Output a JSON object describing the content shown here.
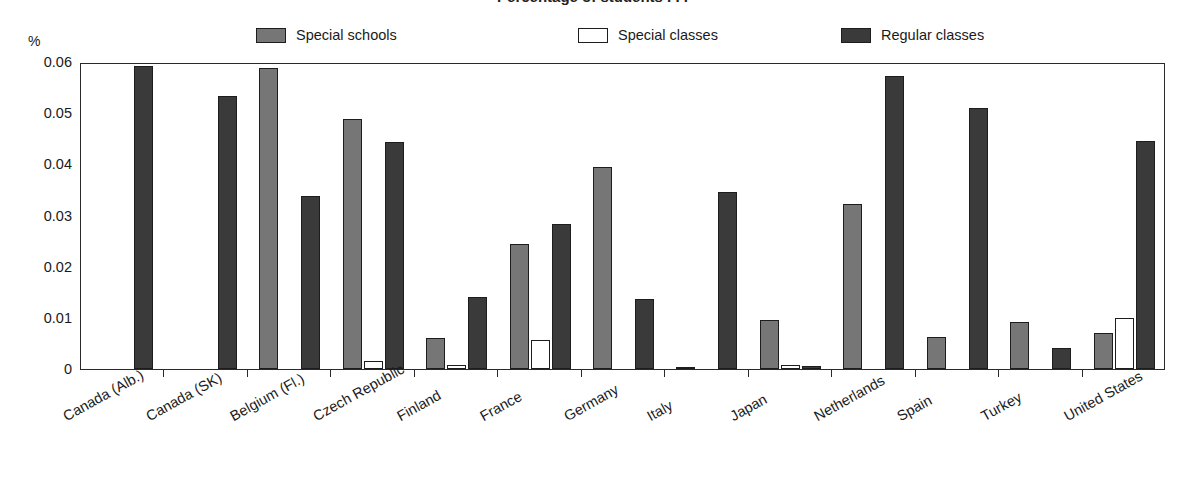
{
  "title_partial": "Percentage of students . . .",
  "axis": {
    "unit_label": "%",
    "y_ticks": [
      "0.06",
      "0.05",
      "0.04",
      "0.03",
      "0.02",
      "0.01",
      "0"
    ]
  },
  "legend": {
    "items": [
      {
        "label": "Special schools",
        "swatch": "#767676",
        "key": "special_schools"
      },
      {
        "label": "Special classes",
        "swatch": "#ffffff",
        "key": "special_classes"
      },
      {
        "label": "Regular classes",
        "swatch": "#3a3a3a",
        "key": "regular_classes"
      }
    ]
  },
  "chart_data": {
    "type": "bar",
    "title": "Percentage of students . . .",
    "xlabel": "",
    "ylabel": "%",
    "ylim": [
      0,
      0.06
    ],
    "yticks": [
      0,
      0.01,
      0.02,
      0.03,
      0.04,
      0.05,
      0.06
    ],
    "grid": false,
    "legend_position": "top",
    "categories": [
      "Canada (Alb.)",
      "Canada (SK)",
      "Belgium (Fl.)",
      "Czech Republic",
      "Finland",
      "France",
      "Germany",
      "Italy",
      "Japan",
      "Netherlands",
      "Spain",
      "Turkey",
      "United States"
    ],
    "series": [
      {
        "name": "Special schools",
        "color": "#767676",
        "values": [
          0,
          0,
          0.0588,
          0.0489,
          0.006,
          0.0245,
          0.0395,
          0.0004,
          0.0095,
          0.0322,
          0.0062,
          0.0092,
          0.0071
        ]
      },
      {
        "name": "Special classes",
        "color": "#ffffff",
        "values": [
          0,
          0,
          0,
          0.0015,
          0.0007,
          0.0057,
          0,
          0,
          0.0008,
          0,
          0,
          0,
          0.01
        ]
      },
      {
        "name": "Regular classes",
        "color": "#3a3a3a",
        "values": [
          0.0592,
          0.0534,
          0.0339,
          0.0443,
          0.0141,
          0.0284,
          0.0137,
          0.0345,
          0.0005,
          0.0572,
          0.051,
          0.0042,
          0.0445
        ]
      }
    ]
  }
}
